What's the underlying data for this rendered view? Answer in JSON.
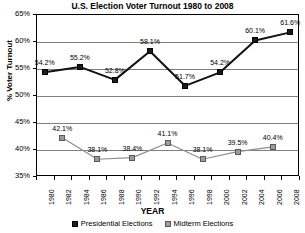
{
  "chart_data": {
    "type": "line",
    "title": "U.S. Election Voter Turnout 1980 to 2008",
    "xlabel": "YEAR",
    "ylabel": "% Voter Turnout",
    "ylim": [
      35,
      65
    ],
    "ytick_labels": [
      "35%",
      "40%",
      "45%",
      "50%",
      "55%",
      "60%",
      "65%"
    ],
    "ytick_values": [
      35,
      40,
      45,
      50,
      55,
      60,
      65
    ],
    "grid": true,
    "legend_position": "bottom",
    "categories": [
      "1980",
      "1982",
      "1984",
      "1986",
      "1988",
      "1990",
      "1992",
      "1994",
      "1996",
      "1998",
      "2000",
      "2002",
      "2004",
      "2006",
      "2008"
    ],
    "series": [
      {
        "name": "Presidential Elections",
        "color": "#1a1a1a",
        "x": [
          "1980",
          "1984",
          "1988",
          "1992",
          "1996",
          "2000",
          "2004",
          "2008"
        ],
        "values": [
          54.2,
          55.2,
          52.8,
          58.1,
          51.7,
          54.2,
          60.1,
          61.6
        ],
        "labels": [
          "54.2%",
          "55.2%",
          "52.8%",
          "58.1%",
          "51.7%",
          "54.2%",
          "60.1%",
          "61.6%"
        ]
      },
      {
        "name": "Midterm Elections",
        "color": "#9b9b9b",
        "x": [
          "1982",
          "1986",
          "1990",
          "1994",
          "1998",
          "2002",
          "2006"
        ],
        "values": [
          42.1,
          38.1,
          38.4,
          41.1,
          38.1,
          39.5,
          40.4
        ],
        "labels": [
          "42.1%",
          "38.1%",
          "38.4%",
          "41.1%",
          "38.1%",
          "39.5%",
          "40.4%"
        ]
      }
    ]
  },
  "legend": {
    "items": [
      {
        "label": "Presidential Elections"
      },
      {
        "label": "Midterm Elections"
      }
    ]
  }
}
